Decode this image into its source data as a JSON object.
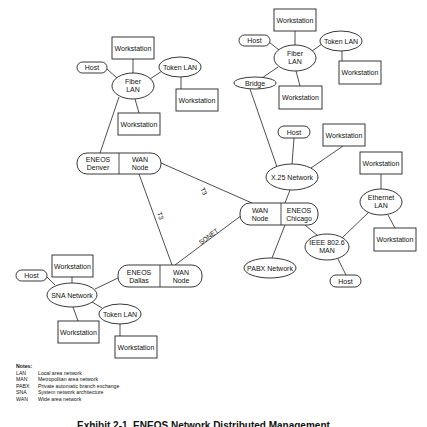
{
  "diagram": {
    "nodes": {
      "denver_fiber_ws_top": {
        "label": "Workstation"
      },
      "denver_host": {
        "label": "Host"
      },
      "denver_fiber_lan": {
        "label_line1": "Fiber",
        "label_line2": "LAN"
      },
      "denver_token_lan": {
        "label": "Token LAN"
      },
      "denver_token_ws": {
        "label": "Workstation"
      },
      "denver_fiber_ws_bottom": {
        "label": "Workstation"
      },
      "denver_eneos": {
        "left_line1": "ENEOS",
        "left_line2": "Denver",
        "right_line1": "WAN",
        "right_line2": "Node"
      },
      "ne_fiber_ws_top": {
        "label": "Workstation"
      },
      "ne_host": {
        "label": "Host"
      },
      "ne_fiber_lan": {
        "label_line1": "Fiber",
        "label_line2": "LAN"
      },
      "ne_token_lan": {
        "label": "Token LAN"
      },
      "ne_token_ws": {
        "label": "Workstation"
      },
      "ne_bridge": {
        "label": "Bridge"
      },
      "ne_fiber_ws_bottom": {
        "label": "Workstation"
      },
      "x25_host": {
        "label": "Host"
      },
      "x25_ws": {
        "label": "Workstation"
      },
      "x25_network": {
        "label": "X.25 Network"
      },
      "chicago_eneos": {
        "left_line1": "WAN",
        "left_line2": "Node",
        "right_line1": "ENEOS",
        "right_line2": "Chicago"
      },
      "pabx_network": {
        "label": "PABX Network"
      },
      "ieee_man": {
        "label_line1": "IEEE 802.6",
        "label_line2": "MAN"
      },
      "ieee_host": {
        "label": "Host"
      },
      "ethernet_ws_top": {
        "label": "Workstation"
      },
      "ethernet_lan": {
        "label_line1": "Ethernet",
        "label_line2": "LAN"
      },
      "ethernet_ws_right": {
        "label": "Workstation"
      },
      "dallas_eneos": {
        "left_line1": "ENEOS",
        "left_line2": "Dallas",
        "right_line1": "WAN",
        "right_line2": "Node"
      },
      "sna_ws_top": {
        "label": "Workstation"
      },
      "sna_host": {
        "label": "Host"
      },
      "sna_network": {
        "label": "SNA Network"
      },
      "sna_token_lan": {
        "label": "Token LAN"
      },
      "sna_ws_bottom": {
        "label": "Workstation"
      },
      "sna_token_ws": {
        "label": "Workstation"
      }
    },
    "links": {
      "denver_chicago": "T3",
      "denver_dallas": "T3",
      "dallas_chicago": "SONET"
    }
  },
  "notes": {
    "title": "Notes:",
    "items": [
      {
        "abbr": "LAN",
        "text": "Local area network"
      },
      {
        "abbr": "MAN",
        "text": "Metropolitan area network"
      },
      {
        "abbr": "PABX",
        "text": "Private automatic branch exchange"
      },
      {
        "abbr": "SNA",
        "text": "System network architecture"
      },
      {
        "abbr": "WAN",
        "text": "Wide area network"
      }
    ]
  },
  "caption": "Exhibit 2-1. ENEOS Network Distributed Management"
}
